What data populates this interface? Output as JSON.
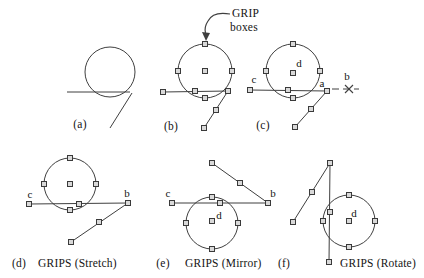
{
  "canvas": {
    "width": 424,
    "height": 278,
    "background": "#ffffff",
    "line_color": "#3f3f3f",
    "grip_fill": "#d9d9d9",
    "grip_stroke": "#3a3a3a",
    "grip_size": 5,
    "text_color": "#141414"
  },
  "annotation": {
    "text_line1": "GRIP",
    "text_line2": "boxes",
    "pos1": [
      232,
      17
    ],
    "pos2": [
      230,
      31
    ],
    "arrow_path": "M 230 14 Q 213 11 208 21 Q 204 27 205.5 33",
    "arrowhead_points": "206,41 202,32 210,33"
  },
  "figures": [
    {
      "id": "a",
      "caption": {
        "text": "(a)",
        "x": 80,
        "y": 128
      },
      "circle": {
        "cx": 110,
        "cy": 72,
        "r": 25
      },
      "lines": [
        [
          67,
          92,
          130,
          92
        ],
        [
          132,
          93,
          110,
          128
        ]
      ],
      "grips": [],
      "point_labels": []
    },
    {
      "id": "b",
      "caption": {
        "text": "(b)",
        "x": 171,
        "y": 130
      },
      "circle": {
        "cx": 205,
        "cy": 71,
        "r": 27
      },
      "lines": [
        [
          163,
          92,
          228,
          91
        ],
        [
          228,
          91,
          204,
          128
        ]
      ],
      "grips": [
        [
          205,
          44
        ],
        [
          178,
          71
        ],
        [
          232,
          71
        ],
        [
          205,
          98
        ],
        [
          205,
          71
        ],
        [
          163,
          92
        ],
        [
          195,
          91
        ],
        [
          228,
          91
        ],
        [
          216,
          110
        ],
        [
          204,
          128
        ]
      ],
      "point_labels": []
    },
    {
      "id": "c",
      "caption": {
        "text": "(c)",
        "x": 263,
        "y": 129
      },
      "circle": {
        "cx": 293,
        "cy": 71,
        "r": 27
      },
      "lines": [
        [
          250,
          90,
          327,
          91
        ],
        [
          327,
          91,
          295,
          127
        ]
      ],
      "dashed_lines": [
        [
          332,
          89,
          359,
          89
        ]
      ],
      "cross": [
        349,
        89
      ],
      "grips": [
        [
          293,
          44
        ],
        [
          266,
          71
        ],
        [
          320,
          71
        ],
        [
          293,
          98
        ],
        [
          293,
          73
        ],
        [
          250,
          90
        ],
        [
          288,
          90
        ],
        [
          327,
          91
        ],
        [
          311,
          109
        ],
        [
          295,
          127
        ]
      ],
      "point_labels": [
        {
          "text": "c",
          "x": 254,
          "y": 83
        },
        {
          "text": "d",
          "x": 299,
          "y": 67
        },
        {
          "text": "a",
          "x": 322,
          "y": 87
        },
        {
          "text": "b",
          "x": 347,
          "y": 80
        }
      ]
    },
    {
      "id": "d",
      "caption": {
        "text": "(d)",
        "x": 19,
        "y": 267
      },
      "title": {
        "text": "GRIPS (Stretch)",
        "x": 38,
        "y": 267
      },
      "circle": {
        "cx": 70,
        "cy": 184,
        "r": 26
      },
      "lines": [
        [
          29,
          204,
          128,
          203
        ],
        [
          128,
          203,
          71,
          242
        ]
      ],
      "grips": [
        [
          70,
          158
        ],
        [
          44,
          184
        ],
        [
          96,
          184
        ],
        [
          70,
          210
        ],
        [
          70,
          184
        ],
        [
          29,
          204
        ],
        [
          79,
          204
        ],
        [
          128,
          203
        ],
        [
          99,
          222
        ],
        [
          71,
          242
        ]
      ],
      "point_labels": [
        {
          "text": "c",
          "x": 30,
          "y": 198
        },
        {
          "text": "b",
          "x": 127,
          "y": 197
        }
      ]
    },
    {
      "id": "e",
      "caption": {
        "text": "(e)",
        "x": 163,
        "y": 267
      },
      "title": {
        "text": "GRIPS (Mirror)",
        "x": 185,
        "y": 267
      },
      "circle": {
        "cx": 212,
        "cy": 223,
        "r": 26
      },
      "lines": [
        [
          172,
          203,
          268,
          203
        ],
        [
          268,
          203,
          212,
          163
        ]
      ],
      "grips": [
        [
          212,
          197
        ],
        [
          186,
          223
        ],
        [
          238,
          223
        ],
        [
          212,
          249
        ],
        [
          212,
          221
        ],
        [
          172,
          203
        ],
        [
          220,
          203
        ],
        [
          268,
          203
        ],
        [
          240,
          183
        ],
        [
          212,
          163
        ]
      ],
      "point_labels": [
        {
          "text": "c",
          "x": 168,
          "y": 197
        },
        {
          "text": "d",
          "x": 219,
          "y": 219
        },
        {
          "text": "b",
          "x": 273,
          "y": 197
        }
      ]
    },
    {
      "id": "f",
      "caption": {
        "text": "(f)",
        "x": 284,
        "y": 267
      },
      "title": {
        "text": "GRIPS (Rotate)",
        "x": 340,
        "y": 267
      },
      "circle": {
        "cx": 349,
        "cy": 221,
        "r": 26
      },
      "lines": [
        [
          330,
          163,
          329,
          262
        ],
        [
          330,
          163,
          293,
          222
        ]
      ],
      "grips": [
        [
          349,
          195
        ],
        [
          323,
          221
        ],
        [
          375,
          221
        ],
        [
          349,
          247
        ],
        [
          349,
          221
        ],
        [
          330,
          163
        ],
        [
          330,
          212
        ],
        [
          329,
          262
        ],
        [
          312,
          192
        ],
        [
          293,
          222
        ]
      ],
      "point_labels": [
        {
          "text": "d",
          "x": 354,
          "y": 217
        }
      ]
    }
  ]
}
